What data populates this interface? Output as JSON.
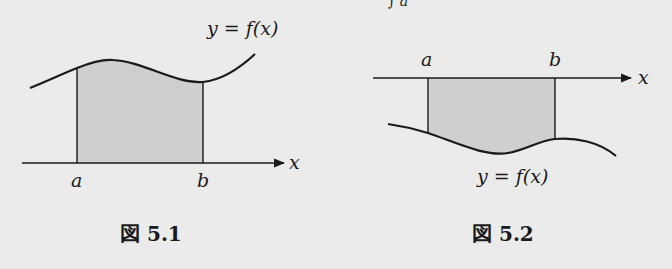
{
  "top_fragment": "∫ a",
  "figures": [
    {
      "caption": "図 5.1",
      "curve_label": "y = f(x)",
      "axis_label": "x",
      "bound_a": "a",
      "bound_b": "b",
      "region": "above x-axis"
    },
    {
      "caption": "図 5.2",
      "curve_label": "y = f(x)",
      "axis_label": "x",
      "bound_a": "a",
      "bound_b": "b",
      "region": "below x-axis"
    }
  ],
  "colors": {
    "background": "#ebebeb",
    "shade": "#cfcfcf",
    "ink": "#1a1a1a"
  }
}
